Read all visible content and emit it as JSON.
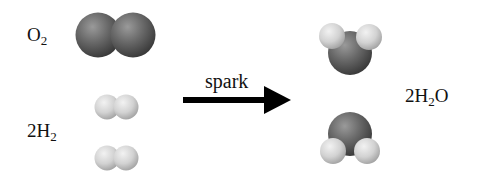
{
  "diagram": {
    "reactants": [
      {
        "coef": "",
        "element": "O",
        "subscript": "2",
        "molecule_count": 1,
        "atom_color": "#5a5a5a"
      },
      {
        "coef": "2",
        "element": "H",
        "subscript": "2",
        "molecule_count": 2,
        "atom_color": "#d4d4d4"
      }
    ],
    "arrow": {
      "label": "spark",
      "direction": "right"
    },
    "products": [
      {
        "coef": "2",
        "prefix": "H",
        "subscript": "2",
        "suffix": "O",
        "molecule_count": 2
      }
    ],
    "colors": {
      "oxygen": "#5a5a5a",
      "hydrogen": "#d4d4d4",
      "text": "#111111",
      "arrow": "#000000"
    }
  }
}
